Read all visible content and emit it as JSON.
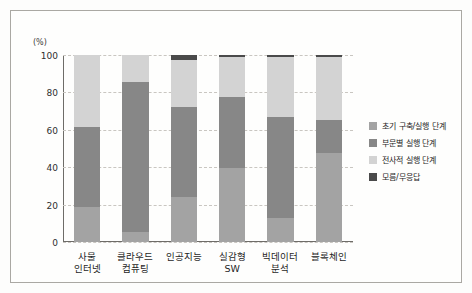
{
  "chart_data": {
    "type": "bar",
    "subtype": "stacked-100-percent",
    "title": "",
    "xlabel": "",
    "ylabel": "(%)",
    "unit_label": "(%)",
    "ylim": [
      0,
      100
    ],
    "yticks": [
      0,
      20,
      40,
      60,
      80,
      100
    ],
    "ytick_labels": [
      "0",
      "20",
      "40",
      "60",
      "80",
      "100"
    ],
    "grid": true,
    "legend_position": "right",
    "categories": [
      "사물\n인터넷",
      "클라우드\n컴퓨팅",
      "인공지능",
      "실감형\nSW",
      "빅데이터\n분석",
      "블록체인"
    ],
    "category_names": [
      "사물 인터넷",
      "클라우드 컴퓨팅",
      "인공지능",
      "실감형 SW",
      "빅데이터 분석",
      "블록체인"
    ],
    "series": [
      {
        "name": "초기 구축/실행 단계",
        "color": "#a3a3a3",
        "values": [
          18.6,
          5.5,
          24.0,
          39.5,
          12.7,
          47.5
        ]
      },
      {
        "name": "부문별 실행 단계",
        "color": "#878787",
        "values": [
          43.1,
          80.0,
          48.0,
          38.0,
          54.3,
          18.0
        ]
      },
      {
        "name": "전사적 실행 단계",
        "color": "#d3d3d3",
        "values": [
          38.3,
          14.5,
          25.5,
          21.5,
          32.0,
          33.5
        ]
      },
      {
        "name": "모름/무응답",
        "color": "#4a4a4a",
        "values": [
          0.0,
          0.0,
          2.5,
          1.0,
          1.0,
          1.0
        ]
      }
    ],
    "legend_entries": [
      {
        "label": "초기 구축/실행 단계",
        "color": "#a3a3a3"
      },
      {
        "label": "부문별 실행 단계",
        "color": "#878787"
      },
      {
        "label": "전사적 실행 단계",
        "color": "#d3d3d3"
      },
      {
        "label": "모름/무응답",
        "color": "#4a4a4a"
      }
    ]
  }
}
